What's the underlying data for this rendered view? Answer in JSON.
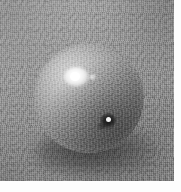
{
  "image": {
    "kind": "photograph",
    "subject": "sphere",
    "caption": "",
    "color_mode": "grayscale",
    "canvas": {
      "width_px": 181,
      "height_px": 192
    },
    "plate": {
      "x_px": 0,
      "y_px": 0,
      "width_px": 174,
      "height_px": 181
    },
    "margins": {
      "right_px": 7,
      "bottom_px": 11,
      "color": "#fdfdfd"
    }
  },
  "background": {
    "name": "textured-grey-surface",
    "base_color": "#8d8d8d",
    "light_tone": "#969696",
    "dark_tone": "#6f6f6f",
    "texture": "fine-grain-canvas"
  },
  "sphere": {
    "name": "sphere",
    "center_x_px": 89,
    "center_y_px": 98,
    "radius_px": 55,
    "rim_color": "#f2f2f2",
    "body_light": "#d8d8d8",
    "body_mid": "#8f8f8f",
    "body_dark": "#4c4c4c",
    "outline_color": "#0c0c0c",
    "specular_color": "#ffffff"
  },
  "features": [
    {
      "name": "specular-highlight",
      "label": "primary specular highlight",
      "x_px": 72,
      "y_px": 76,
      "color": "#ffffff"
    },
    {
      "name": "secondary-glint",
      "label": "secondary glint",
      "x_px": 92,
      "y_px": 80,
      "color": "#f0f0f0"
    },
    {
      "name": "dark-blemish",
      "label": "dark surface blemish",
      "x_px": 108,
      "y_px": 121,
      "color": "#0a0a0a"
    },
    {
      "name": "cast-shadow",
      "label": "cast contact shadow",
      "x_px": 98,
      "y_px": 156,
      "color": "#3a3a3a"
    }
  ]
}
